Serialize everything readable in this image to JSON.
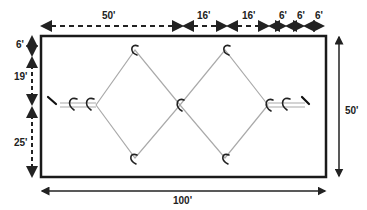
{
  "diagram": {
    "field_width_label": "100'",
    "field_height_label": "50'",
    "top_dimensions": [
      "50'",
      "16'",
      "16'",
      "6'",
      "6'",
      "6'"
    ],
    "left_dimensions": [
      "6'",
      "19'",
      "25'"
    ],
    "line_color": "#aaaaaa",
    "border_color": "#1a1a1a"
  }
}
